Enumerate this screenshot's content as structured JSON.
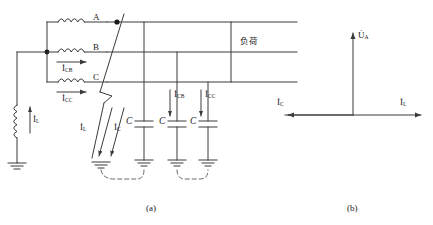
{
  "figure": {
    "title": "",
    "panels": [
      {
        "id": "a",
        "caption": "(a)",
        "description": "circuit-schematic"
      },
      {
        "id": "b",
        "caption": "(b)",
        "description": "phasor-diagram"
      }
    ]
  },
  "circuit": {
    "phase_labels": [
      "A",
      "B",
      "C"
    ],
    "load_text": "负荷",
    "coil_current_label": {
      "symbol": "I",
      "sub": "L"
    },
    "winding_currents": [
      {
        "symbol": "I",
        "sub": "CB"
      },
      {
        "symbol": "I",
        "sub": "CC"
      }
    ],
    "fault_currents": [
      {
        "symbol": "I",
        "sub": "L"
      },
      {
        "symbol": "I",
        "sub": "C"
      }
    ],
    "capacitor_labels": [
      "C",
      "C",
      "C"
    ],
    "capacitor_currents": [
      {
        "symbol": "I",
        "sub": "CB"
      },
      {
        "symbol": "I",
        "sub": "CC"
      }
    ],
    "colors": {
      "line": "#3b3b3b",
      "text": "#1a1a1a",
      "dashed": "#6b6b6b"
    }
  },
  "phasor": {
    "voltage": {
      "symbol": "U",
      "sub": "A"
    },
    "current_left": {
      "symbol": "I",
      "sub": "C"
    },
    "current_right": {
      "symbol": "I",
      "sub": "L"
    }
  }
}
